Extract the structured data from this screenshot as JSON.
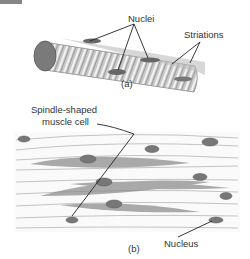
{
  "figure": {
    "panel_a": {
      "caption": "(a)",
      "labels": {
        "nuclei": "Nuclei",
        "striations": "Striations"
      }
    },
    "panel_b": {
      "caption": "(b)",
      "labels": {
        "spindle_line1": "Spindle-shaped",
        "spindle_line2": "muscle cell",
        "nucleus": "Nucleus"
      }
    },
    "colors": {
      "ink": "#333333",
      "fiber": "#9a9a9a",
      "fiber_light": "#d8d8d8",
      "nucleus": "#6e6e6e",
      "background": "#ffffff"
    }
  }
}
